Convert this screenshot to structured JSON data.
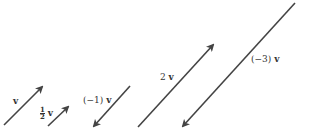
{
  "diagram": {
    "stroke_color": "#444444",
    "vectors": [
      {
        "label": "v",
        "x1": 4,
        "y1": 125,
        "x2": 42,
        "y2": 87
      },
      {
        "label": "½ v",
        "x1": 48,
        "y1": 126,
        "x2": 68,
        "y2": 107
      },
      {
        "label": "(−1) v",
        "x1": 130,
        "y1": 86,
        "x2": 94,
        "y2": 126
      },
      {
        "label": "2 v",
        "x1": 138,
        "y1": 127,
        "x2": 213,
        "y2": 45
      },
      {
        "label": "(−3) v",
        "x1": 295,
        "y1": 3,
        "x2": 183,
        "y2": 126
      }
    ],
    "labels": {
      "v": "v",
      "half_num": "1",
      "half_den": "2",
      "half_v": "v",
      "neg1": "(−1)",
      "neg1_v": "v",
      "two": "2",
      "two_v": "v",
      "neg3": "(−3)",
      "neg3_v": "v"
    }
  }
}
